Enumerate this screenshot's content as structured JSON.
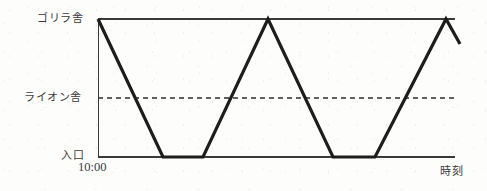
{
  "figure": {
    "caption": "",
    "kind": "line-graph",
    "ink_color": "#1d1d1d",
    "axis_color": "#3a3a3a"
  },
  "labels": {
    "y_top": "ゴリラ舎",
    "y_middle": "ライオン舎",
    "y_bottom": "入口",
    "x_axis": "時刻",
    "x_start_tick": "10:00"
  },
  "chart_data": {
    "type": "line",
    "title": "",
    "xlabel": "時刻",
    "ylabel": "",
    "grid": false,
    "legend": null,
    "x": [
      0,
      18.2,
      29.4,
      47.6,
      65.8,
      77.6,
      97.5,
      101.4
    ],
    "y": [
      100,
      0,
      0,
      100,
      0,
      0,
      100,
      82
    ],
    "ylim": [
      0,
      100
    ],
    "xlim": [
      0,
      101.4
    ],
    "ytick_labels": [
      "入口",
      "ライオン舎",
      "ゴリラ舎"
    ],
    "ytick_values": [
      0,
      57,
      100
    ],
    "xtick_labels": [
      "10:00"
    ],
    "xtick_values": [
      0
    ],
    "reference_lines": [
      {
        "name": "ライオン舎",
        "y": 57,
        "style": "dashed"
      },
      {
        "name": "ゴリラ舎",
        "y": 100,
        "style": "solid"
      }
    ],
    "annotations": [
      {
        "text": "入口",
        "kind": "y-tick"
      },
      {
        "text": "ライオン舎",
        "kind": "y-tick"
      },
      {
        "text": "ゴリラ舎",
        "kind": "y-tick"
      },
      {
        "text": "10:00",
        "kind": "x-tick"
      },
      {
        "text": "時刻",
        "kind": "axis-title"
      }
    ],
    "series": [
      {
        "name": "位置",
        "points": [
          {
            "x": 0,
            "y": 100
          },
          {
            "x": 18.2,
            "y": 0
          },
          {
            "x": 29.4,
            "y": 0
          },
          {
            "x": 47.6,
            "y": 100
          },
          {
            "x": 65.8,
            "y": 0
          },
          {
            "x": 77.6,
            "y": 0
          },
          {
            "x": 97.5,
            "y": 100
          },
          {
            "x": 101.4,
            "y": 82
          }
        ]
      }
    ]
  },
  "geometry": {
    "plot_left": 98,
    "plot_right": 455,
    "plot_top": 19,
    "plot_bottom": 157,
    "dashed_y": 98,
    "path_points": "98,19 163,157 203,157 268,19 333,157 375,157 446,19 460,44"
  }
}
